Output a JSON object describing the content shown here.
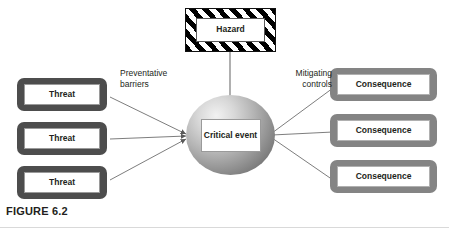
{
  "figure": {
    "caption": "FIGURE 6.2",
    "width": 449,
    "height": 231,
    "background": "#ffffff"
  },
  "diagram": {
    "type": "bowtie-risk-diagram",
    "hazard": {
      "label": "Hazard",
      "frame_style": "diagonal-hazard-stripes",
      "frame_colors": [
        "#000000",
        "#ffffff"
      ]
    },
    "critical_event": {
      "label": "Critical\nevent",
      "shape": "circle",
      "fill": "radial-gradient-grey",
      "colors": [
        "#f2f2f2",
        "#5e5e5e"
      ]
    },
    "threats": [
      {
        "label": "Threat"
      },
      {
        "label": "Threat"
      },
      {
        "label": "Threat"
      }
    ],
    "threat_frame_color": "#4d4d4d",
    "consequences": [
      {
        "label": "Consequence"
      },
      {
        "label": "Consequence"
      },
      {
        "label": "Consequence"
      }
    ],
    "consequence_frame_color": "#848484",
    "annotations": {
      "left_barriers": "Preventative\nbarriers",
      "right_controls": "Mitigating\ncontrols"
    },
    "connector_color": "#6e6e6e"
  }
}
